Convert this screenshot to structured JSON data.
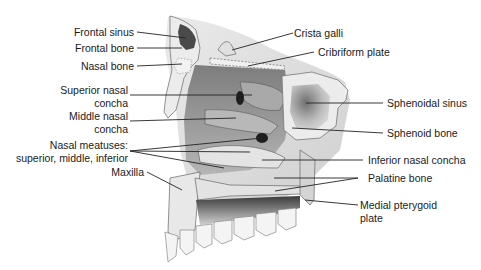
{
  "diagram": {
    "labels_left": {
      "frontal_sinus": "Frontal sinus",
      "frontal_bone": "Frontal bone",
      "nasal_bone": "Nasal bone",
      "superior_nasal_concha_l1": "Superior nasal",
      "superior_nasal_concha_l2": "concha",
      "middle_nasal_concha_l1": "Middle nasal",
      "middle_nasal_concha_l2": "concha",
      "nasal_meatuses_l1": "Nasal meatuses:",
      "nasal_meatuses_l2": "superior, middle, inferior",
      "maxilla": "Maxilla"
    },
    "labels_right": {
      "crista_galli": "Crista galli",
      "cribriform_plate": "Cribriform plate",
      "sphenoidal_sinus": "Sphenoidal sinus",
      "sphenoid_bone": "Sphenoid bone",
      "inferior_nasal_concha": "Inferior nasal concha",
      "palatine_bone": "Palatine bone",
      "medial_pterygoid_plate_l1": "Medial pterygoid",
      "medial_pterygoid_plate_l2": "plate"
    },
    "colors": {
      "background": "#ffffff",
      "text": "#1a1a1a",
      "leader_line": "#222222",
      "bone_light": "#e6e6e6",
      "bone_mid": "#bdbdbd",
      "cavity_dark": "#8a8a8a",
      "shadow": "#2b2b2b"
    }
  }
}
